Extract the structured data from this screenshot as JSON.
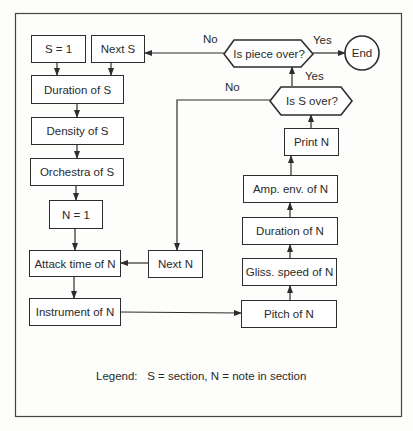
{
  "diagram": {
    "type": "flowchart",
    "colors": {
      "stroke": "#2d2d2d",
      "background": "#fdfdfb"
    },
    "nodes": {
      "s_equals_1": "S = 1",
      "next_s": "Next S",
      "duration_of_s": "Duration of S",
      "density_of_s": "Density of S",
      "orchestra_of_s": "Orchestra of S",
      "n_equals_1": "N = 1",
      "attack_time_of_n": "Attack time of N",
      "instrument_of_n": "Instrument of N",
      "next_n": "Next N",
      "pitch_of_n": "Pitch of N",
      "gliss_speed_of_n": "Gliss. speed of N",
      "duration_of_n": "Duration of N",
      "amp_env_of_n": "Amp. env. of N",
      "print_n": "Print N",
      "is_s_over": "Is S over?",
      "is_piece_over": "Is piece over?",
      "end": "End"
    },
    "edge_labels": {
      "piece_no": "No",
      "piece_yes": "Yes",
      "s_no": "No",
      "s_yes": "Yes"
    },
    "legend": "Legend:   S = section, N = note in section"
  }
}
